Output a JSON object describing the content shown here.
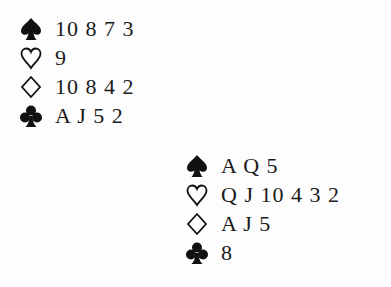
{
  "hands": [
    {
      "position": "top-left",
      "suits": [
        {
          "suit": "spades",
          "cards": "10 8 7 3"
        },
        {
          "suit": "hearts",
          "cards": "9"
        },
        {
          "suit": "diamonds",
          "cards": "10 8 4 2"
        },
        {
          "suit": "clubs",
          "cards": "A J 5 2"
        }
      ]
    },
    {
      "position": "bottom-right",
      "suits": [
        {
          "suit": "spades",
          "cards": "A Q 5"
        },
        {
          "suit": "hearts",
          "cards": "Q J 10 4 3 2"
        },
        {
          "suit": "diamonds",
          "cards": "A J 5"
        },
        {
          "suit": "clubs",
          "cards": "8"
        }
      ]
    }
  ]
}
